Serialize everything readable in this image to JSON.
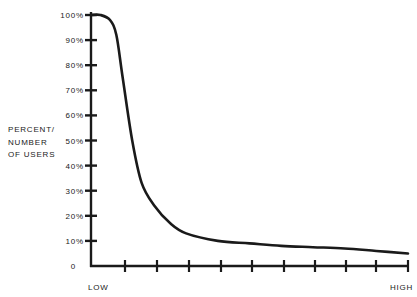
{
  "chart_data": {
    "type": "line",
    "title": "",
    "xlabel": "",
    "ylabel": "PERCENT/ NUMBER OF USERS",
    "ylabel_lines": [
      "PERCENT/",
      "NUMBER",
      "OF USERS"
    ],
    "x_tick_labels": {
      "start": "LOW",
      "end": "HIGH"
    },
    "x_ticks": 10,
    "y_tick_labels": [
      "0",
      "10%",
      "20%",
      "30%",
      "40%",
      "50%",
      "60%",
      "70%",
      "80%",
      "90%",
      "100%"
    ],
    "ylim": [
      0,
      100
    ],
    "xlim": [
      0,
      10
    ],
    "grid": false,
    "legend": null,
    "series": [
      {
        "name": "users",
        "x": [
          0,
          0.3,
          0.6,
          0.8,
          1.0,
          1.3,
          1.6,
          2.0,
          2.5,
          3.0,
          4.0,
          5.0,
          6.0,
          7.0,
          8.0,
          9.0,
          10.0
        ],
        "values": [
          100,
          100,
          98,
          92,
          75,
          50,
          33,
          24,
          17,
          13,
          10,
          9,
          8,
          7.5,
          7,
          6,
          5
        ]
      }
    ],
    "colors": {
      "line": "#1a1a1a",
      "axis": "#1a1a1a",
      "background": "#ffffff"
    }
  }
}
